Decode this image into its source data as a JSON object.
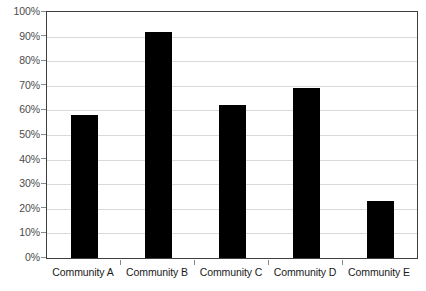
{
  "chart_data": {
    "type": "bar",
    "title": "",
    "subtitle": "",
    "xlabel": "",
    "ylabel": "",
    "categories": [
      "Community A",
      "Community B",
      "Community C",
      "Community D",
      "Community E"
    ],
    "values": [
      58,
      92,
      62,
      69,
      23
    ],
    "series": [
      {
        "name": "",
        "values": [
          58,
          92,
          62,
          69,
          23
        ]
      }
    ],
    "ylim": [
      0,
      100
    ],
    "ytick_labels": [
      "0%",
      "10%",
      "20%",
      "30%",
      "40%",
      "50%",
      "60%",
      "70%",
      "80%",
      "90%",
      "100%"
    ],
    "ytick_values": [
      0,
      10,
      20,
      30,
      40,
      50,
      60,
      70,
      80,
      90,
      100
    ],
    "value_suffix": "%",
    "grid": true,
    "grid_axis": "y",
    "legend": false,
    "legend_position": "none",
    "bar_color": "#000000",
    "grid_color": "#d9d9d9",
    "frame_color": "#3f3f3f",
    "tick_label_color": "#4b4b4b",
    "category_label_color": "#1a1a1a",
    "background_color": "#ffffff"
  }
}
